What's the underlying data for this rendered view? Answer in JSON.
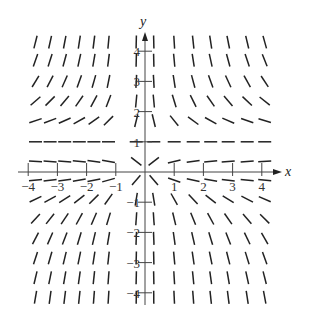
{
  "diagram": {
    "type": "slope-field",
    "equation_inferred": "dy/dx = y(1 - y)/x",
    "axes": {
      "x_label": "x",
      "y_label": "y",
      "x_ticks": [
        -4,
        -3,
        -2,
        -1,
        1,
        2,
        3,
        4
      ],
      "y_ticks": [
        -4,
        -3,
        -2,
        -1,
        1,
        2,
        3,
        4
      ],
      "x_tick_labels": [
        "−4",
        "−3",
        "−2",
        "−1",
        "1",
        "2",
        "3",
        "4"
      ],
      "y_tick_labels": [
        "−4",
        "−3",
        "−2",
        "−1",
        "1",
        "2",
        "3",
        "4"
      ],
      "xlim": [
        -4.3,
        4.5
      ],
      "ylim": [
        -4.4,
        4.6
      ]
    },
    "grid": {
      "x_values": [
        -3.75,
        -3.25,
        -2.75,
        -2.25,
        -1.75,
        -1.25,
        -0.3,
        0.3,
        1.0,
        1.65,
        2.25,
        2.85,
        3.5,
        4.1
      ],
      "y_values": [
        4.3,
        3.7,
        3.0,
        2.35,
        1.7,
        1.0,
        0.35,
        -0.27,
        -0.9,
        -1.55,
        -2.2,
        -2.85,
        -3.5,
        -4.15
      ]
    },
    "colors": {
      "axis": "#444444",
      "segment": "#222222",
      "background": "#ffffff"
    }
  }
}
